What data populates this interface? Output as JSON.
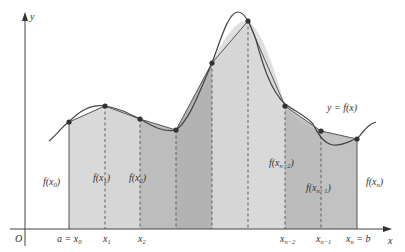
{
  "figure": {
    "curve_label": "y = f(x)",
    "axes": {
      "x_label": "x",
      "y_label": "y",
      "origin_label": "O"
    },
    "x_ticks": [
      {
        "main": "a = x",
        "sub": "0"
      },
      {
        "main": "x",
        "sub": "1"
      },
      {
        "main": "x",
        "sub": "2"
      },
      {
        "main": "x",
        "sub": "n−2"
      },
      {
        "main": "x",
        "sub": "n−1"
      },
      {
        "main": "x",
        "sub": "n",
        "tail": " = b"
      }
    ],
    "value_labels": [
      {
        "main": "f(x",
        "sub": "0",
        "tail": ")"
      },
      {
        "main": "f(x",
        "sub": "1",
        "tail": ")"
      },
      {
        "main": "f(x",
        "sub": "2",
        "tail": ")"
      },
      {
        "main": "f(x",
        "sub": "n−2",
        "tail": ")"
      },
      {
        "main": "f(x",
        "sub": "n−1",
        "tail": ")"
      },
      {
        "main": "f(x",
        "sub": "n",
        "tail": ")"
      }
    ],
    "colors": {
      "strip_light": "#d9d9d9",
      "strip_mid": "#c4c4c4",
      "strip_dark": "#b5b5b5",
      "curve": "#444444",
      "point": "#333333",
      "axis": "#444444"
    }
  }
}
